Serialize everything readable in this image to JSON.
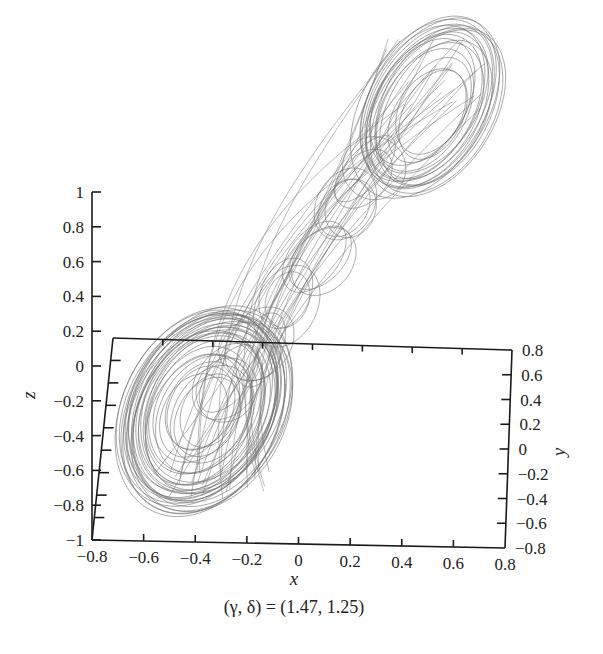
{
  "chart_data": {
    "type": "line",
    "subtype": "3d-trajectory",
    "title": "",
    "caption": "(γ, δ) = (1.47, 1.25)",
    "parameters": {
      "gamma": 1.47,
      "delta": 1.25
    },
    "xlabel": "x",
    "ylabel": "y",
    "zlabel": "z",
    "xlim": [
      -0.8,
      0.8
    ],
    "ylim": [
      -0.8,
      0.8
    ],
    "zlim": [
      -1,
      1
    ],
    "x_ticks": [
      "-0.8",
      "-0.6",
      "-0.4",
      "-0.2",
      "0",
      "0.2",
      "0.4",
      "0.6",
      "0.8"
    ],
    "y_ticks": [
      "0.8",
      "0.6",
      "0.4",
      "0.2",
      "0",
      "-0.2",
      "-0.4",
      "-0.6",
      "-0.8"
    ],
    "z_ticks": [
      "1",
      "0.8",
      "0.6",
      "0.4",
      "0.2",
      "0",
      "-0.2",
      "-0.4",
      "-0.6",
      "-0.8",
      "-1"
    ],
    "grid": false,
    "legend": null,
    "series": [
      {
        "name": "trajectory",
        "color": "#6e6e6e",
        "description": "Double-scroll chaotic attractor with two lobes: lower lobe centered near (x,z)≈(-0.4,-0.3), upper lobe centered near (x,z)≈(0.45,0.9 above plotted box), connected by a diagonal band of looping orbits."
      }
    ],
    "lobes": [
      {
        "name": "lower",
        "center_px": [
          205,
          410
        ],
        "rx": 78,
        "ry": 110,
        "rotation_deg": 28
      },
      {
        "name": "upper",
        "center_px": [
          430,
          105
        ],
        "rx": 62,
        "ry": 100,
        "rotation_deg": 30
      }
    ]
  },
  "labels": {
    "z_axis": "z",
    "x_axis": "x",
    "y_axis": "y",
    "caption": "(γ, δ) = (1.47, 1.25)"
  },
  "colors": {
    "axis": "#1a1a1a",
    "trajectory": "#707070",
    "background": "#ffffff"
  }
}
